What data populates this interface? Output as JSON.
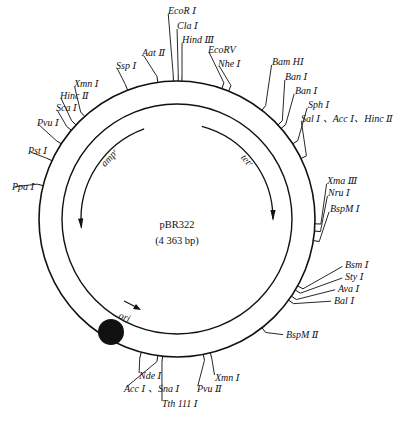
{
  "plasmid": {
    "name": "pBR322",
    "size_label": "(4 363 bp)"
  },
  "geometry": {
    "cx": 177,
    "cy": 219,
    "outer_r": 138,
    "inner_r": 115,
    "gene_r": 96,
    "line_color": "#111111"
  },
  "genes": [
    {
      "name": "amp_r",
      "label": "ampʳ",
      "start_deg": -20,
      "end_deg": -95,
      "direction": "counterclockwise"
    },
    {
      "name": "tet_r",
      "label": "tetʳ",
      "start_deg": 15,
      "end_deg": 90,
      "direction": "clockwise"
    }
  ],
  "ori": {
    "label": "ori",
    "marker": "filled-circle"
  },
  "sites": [
    {
      "label": "EcoR Ⅰ",
      "angle": -1.5,
      "lx": 168,
      "ly": 14,
      "anchor": "start"
    },
    {
      "label": "Cla Ⅰ",
      "angle": 0.5,
      "lx": 177,
      "ly": 29,
      "anchor": "start"
    },
    {
      "label": "Hind Ⅲ",
      "angle": 2,
      "lx": 182,
      "ly": 43,
      "anchor": "start"
    },
    {
      "label": "EcoRV",
      "angle": 19,
      "lx": 208,
      "ly": 53,
      "anchor": "start"
    },
    {
      "label": "Nhe Ⅰ",
      "angle": 22,
      "lx": 218,
      "ly": 67,
      "anchor": "start"
    },
    {
      "label": "Bam HⅠ",
      "angle": 38,
      "lx": 272,
      "ly": 65,
      "anchor": "start"
    },
    {
      "label": "Ban Ⅰ",
      "angle": 47,
      "lx": 285,
      "ly": 80,
      "anchor": "start"
    },
    {
      "label": "Ban Ⅰ",
      "angle": 49,
      "lx": 295,
      "ly": 94,
      "anchor": "start"
    },
    {
      "label": "Sph Ⅰ",
      "angle": 57,
      "lx": 308,
      "ly": 108,
      "anchor": "start"
    },
    {
      "label": "Sal Ⅰ 、Acc Ⅰ、Hinc Ⅱ",
      "angle": 64,
      "lx": 301,
      "ly": 122,
      "anchor": "start"
    },
    {
      "label": "Xma Ⅲ",
      "angle": 92,
      "lx": 327,
      "ly": 184,
      "anchor": "start"
    },
    {
      "label": "Nru Ⅰ",
      "angle": 95,
      "lx": 328,
      "ly": 196,
      "anchor": "start"
    },
    {
      "label": "BspM Ⅰ",
      "angle": 99,
      "lx": 330,
      "ly": 212,
      "anchor": "start"
    },
    {
      "label": "Bsm Ⅰ",
      "angle": 119,
      "lx": 345,
      "ly": 268,
      "anchor": "start"
    },
    {
      "label": "Sty Ⅰ",
      "angle": 121,
      "lx": 345,
      "ly": 280,
      "anchor": "start"
    },
    {
      "label": "Ava Ⅰ",
      "angle": 124,
      "lx": 338,
      "ly": 292,
      "anchor": "start"
    },
    {
      "label": "Bal Ⅰ",
      "angle": 126,
      "lx": 334,
      "ly": 304,
      "anchor": "start"
    },
    {
      "label": "BspM Ⅱ",
      "angle": 142,
      "lx": 286,
      "ly": 338,
      "anchor": "start"
    },
    {
      "label": "Xmn Ⅰ",
      "angle": 166,
      "lx": 215,
      "ly": 381,
      "anchor": "start"
    },
    {
      "label": "Pvu Ⅱ",
      "angle": 169,
      "lx": 197,
      "ly": 392,
      "anchor": "start"
    },
    {
      "label": "Tth 111 Ⅰ",
      "angle": 186,
      "lx": 162,
      "ly": 407,
      "anchor": "start"
    },
    {
      "label": "Acc Ⅰ 、Sna Ⅰ",
      "angle": 188,
      "lx": 124,
      "ly": 392,
      "anchor": "start"
    },
    {
      "label": "Nde Ⅰ",
      "angle": 195,
      "lx": 139,
      "ly": 379,
      "anchor": "start"
    },
    {
      "label": "Ppa Ⅰ",
      "angle": 284,
      "lx": 12,
      "ly": 190,
      "anchor": "start"
    },
    {
      "label": "Pst Ⅰ",
      "angle": 295,
      "lx": 28,
      "ly": 154,
      "anchor": "start"
    },
    {
      "label": "Pvu Ⅰ",
      "angle": 303,
      "lx": 37,
      "ly": 126,
      "anchor": "start"
    },
    {
      "label": "Sca Ⅰ",
      "angle": 310,
      "lx": 56,
      "ly": 111,
      "anchor": "start"
    },
    {
      "label": "Hinc Ⅱ",
      "angle": 313,
      "lx": 60,
      "ly": 99,
      "anchor": "start"
    },
    {
      "label": "Xmn Ⅰ",
      "angle": 318,
      "lx": 74,
      "ly": 87,
      "anchor": "start"
    },
    {
      "label": "Ssp Ⅰ",
      "angle": 339,
      "lx": 116,
      "ly": 69,
      "anchor": "start"
    },
    {
      "label": "Aat Ⅱ",
      "angle": 352,
      "lx": 142,
      "ly": 56,
      "anchor": "start"
    }
  ]
}
